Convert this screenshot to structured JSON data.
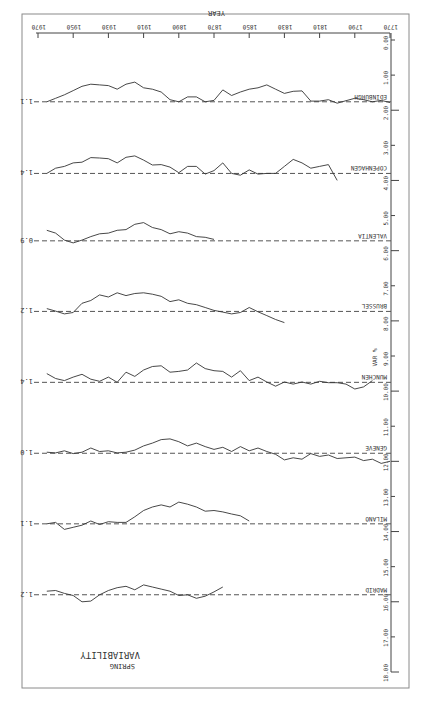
{
  "chart_data": {
    "type": "line",
    "title": "VARIABILITY",
    "subtitle": "SPRING",
    "xlabel": "YEAR",
    "ylabel": "VAR %",
    "xlim": [
      1770,
      1970
    ],
    "ylim": [
      0,
      18
    ],
    "x_ticks": [
      "1770",
      "1790",
      "1810",
      "1830",
      "1850",
      "1870",
      "1890",
      "1910",
      "1930",
      "1950",
      "1970"
    ],
    "y_ticks": [
      "0.00",
      "1.00",
      "2.00",
      "3.00",
      "4.00",
      "5.00",
      "6.00",
      "7.00",
      "8.00",
      "9.00",
      "10.00",
      "11.00",
      "12.00",
      "13.00",
      "14.00",
      "15.00",
      "16.00",
      "17.00",
      "18.00"
    ],
    "grid": false,
    "legend_position": "none",
    "series": [
      {
        "name": "EDINBURGH",
        "mean_value": "1.1",
        "baseline": 1.76,
        "x": [
          1770,
          1775,
          1780,
          1785,
          1790,
          1795,
          1800,
          1805,
          1810,
          1815,
          1820,
          1825,
          1830,
          1835,
          1840,
          1845,
          1850,
          1855,
          1860,
          1865,
          1870,
          1875,
          1880,
          1885,
          1890,
          1895,
          1900,
          1905,
          1910,
          1915,
          1920,
          1925,
          1930,
          1935,
          1940,
          1945,
          1950,
          1955,
          1960,
          1965
        ],
        "y": [
          1.78,
          1.72,
          1.76,
          1.7,
          1.66,
          1.73,
          1.8,
          1.7,
          1.74,
          1.74,
          1.45,
          1.46,
          1.52,
          1.4,
          1.28,
          1.36,
          1.4,
          1.48,
          1.58,
          1.42,
          1.72,
          1.76,
          1.62,
          1.62,
          1.76,
          1.7,
          1.48,
          1.4,
          1.36,
          1.2,
          1.26,
          1.4,
          1.3,
          1.28,
          1.26,
          1.32,
          1.44,
          1.56,
          1.66,
          1.76
        ]
      },
      {
        "name": "COPENHAGEN",
        "mean_value": "1.4",
        "baseline": 3.8,
        "x": [
          1800,
          1805,
          1810,
          1815,
          1820,
          1825,
          1830,
          1835,
          1840,
          1845,
          1850,
          1855,
          1860,
          1865,
          1870,
          1875,
          1880,
          1885,
          1890,
          1895,
          1900,
          1905,
          1910,
          1915,
          1920,
          1925,
          1930,
          1935,
          1940,
          1945,
          1950,
          1955,
          1960,
          1965
        ],
        "y": [
          4.0,
          3.55,
          3.6,
          3.65,
          3.5,
          3.4,
          3.6,
          3.8,
          3.8,
          3.82,
          3.7,
          3.85,
          3.8,
          3.5,
          3.72,
          3.82,
          3.6,
          3.6,
          3.78,
          3.62,
          3.55,
          3.56,
          3.42,
          3.3,
          3.34,
          3.5,
          3.38,
          3.36,
          3.35,
          3.48,
          3.5,
          3.6,
          3.65,
          3.8
        ]
      },
      {
        "name": "VALENTIA",
        "mean_value": "0.9",
        "baseline": 5.72,
        "x": [
          1870,
          1875,
          1880,
          1885,
          1890,
          1895,
          1900,
          1905,
          1910,
          1915,
          1920,
          1925,
          1930,
          1935,
          1940,
          1945,
          1950,
          1955,
          1960,
          1965
        ],
        "y": [
          5.68,
          5.62,
          5.6,
          5.5,
          5.46,
          5.52,
          5.4,
          5.34,
          5.2,
          5.25,
          5.4,
          5.42,
          5.5,
          5.52,
          5.6,
          5.7,
          5.78,
          5.7,
          5.5,
          5.42
        ]
      },
      {
        "name": "BRUSSEL",
        "mean_value": "1.2",
        "baseline": 7.73,
        "x": [
          1830,
          1835,
          1840,
          1845,
          1850,
          1855,
          1860,
          1865,
          1870,
          1875,
          1880,
          1885,
          1890,
          1895,
          1900,
          1905,
          1910,
          1915,
          1920,
          1925,
          1930,
          1935,
          1940,
          1945,
          1950,
          1955,
          1960,
          1965
        ],
        "y": [
          8.05,
          7.96,
          7.85,
          7.74,
          7.62,
          7.76,
          7.8,
          7.75,
          7.7,
          7.62,
          7.54,
          7.5,
          7.4,
          7.45,
          7.3,
          7.24,
          7.2,
          7.22,
          7.28,
          7.2,
          7.32,
          7.26,
          7.42,
          7.5,
          7.76,
          7.8,
          7.72,
          7.65
        ]
      },
      {
        "name": "MUNCHEN",
        "mean_value": "1.4",
        "baseline": 9.75,
        "x": [
          1780,
          1785,
          1790,
          1795,
          1800,
          1805,
          1810,
          1815,
          1820,
          1825,
          1830,
          1835,
          1840,
          1845,
          1850,
          1855,
          1860,
          1865,
          1870,
          1875,
          1880,
          1885,
          1890,
          1895,
          1900,
          1905,
          1910,
          1915,
          1920,
          1925,
          1930,
          1935,
          1940,
          1945,
          1950,
          1955,
          1960,
          1965
        ],
        "y": [
          9.7,
          9.88,
          9.94,
          9.8,
          9.76,
          9.76,
          9.72,
          9.8,
          9.74,
          9.8,
          9.74,
          9.86,
          9.74,
          9.6,
          9.7,
          9.42,
          9.6,
          9.44,
          9.42,
          9.36,
          9.2,
          9.4,
          9.44,
          9.46,
          9.28,
          9.3,
          9.4,
          9.58,
          9.46,
          9.75,
          9.6,
          9.72,
          9.66,
          9.52,
          9.6,
          9.7,
          9.64,
          9.5
        ]
      },
      {
        "name": "GENEVE",
        "mean_value": "1.0",
        "baseline": 11.77,
        "x": [
          1770,
          1775,
          1780,
          1785,
          1790,
          1795,
          1800,
          1805,
          1810,
          1815,
          1820,
          1825,
          1830,
          1835,
          1840,
          1845,
          1850,
          1855,
          1860,
          1865,
          1870,
          1875,
          1880,
          1885,
          1890,
          1895,
          1900,
          1905,
          1910,
          1915,
          1920,
          1925,
          1930,
          1935,
          1940,
          1945,
          1950,
          1955,
          1960,
          1965
        ],
        "y": [
          12.0,
          12.06,
          11.94,
          11.98,
          11.88,
          11.9,
          11.92,
          11.82,
          11.86,
          11.78,
          11.94,
          11.9,
          11.96,
          11.8,
          11.72,
          11.62,
          11.7,
          11.58,
          11.72,
          11.6,
          11.66,
          11.58,
          11.48,
          11.56,
          11.44,
          11.36,
          11.38,
          11.48,
          11.56,
          11.68,
          11.74,
          11.76,
          11.7,
          11.72,
          11.62,
          11.74,
          11.78,
          11.7,
          11.76,
          11.74
        ]
      },
      {
        "name": "MILANO",
        "mean_value": "1.1",
        "baseline": 13.78,
        "x": [
          1850,
          1855,
          1860,
          1865,
          1870,
          1875,
          1880,
          1885,
          1890,
          1895,
          1900,
          1905,
          1910,
          1915,
          1920,
          1925,
          1930,
          1935,
          1940,
          1945,
          1950,
          1955,
          1960,
          1965
        ],
        "y": [
          13.7,
          13.55,
          13.5,
          13.44,
          13.4,
          13.42,
          13.3,
          13.22,
          13.16,
          13.3,
          13.24,
          13.3,
          13.4,
          13.58,
          13.74,
          13.74,
          13.72,
          13.8,
          13.7,
          13.82,
          13.88,
          13.94,
          13.74,
          13.78
        ]
      },
      {
        "name": "MADRID",
        "mean_value": "1.2",
        "baseline": 15.8,
        "x": [
          1865,
          1870,
          1875,
          1880,
          1885,
          1890,
          1895,
          1900,
          1905,
          1910,
          1915,
          1920,
          1925,
          1930,
          1935,
          1940,
          1945,
          1950,
          1955,
          1960,
          1965
        ],
        "y": [
          15.58,
          15.72,
          15.84,
          15.9,
          15.8,
          15.82,
          15.7,
          15.64,
          15.58,
          15.52,
          15.66,
          15.56,
          15.6,
          15.68,
          15.8,
          15.98,
          16.0,
          15.82,
          15.76,
          15.68,
          15.7
        ]
      }
    ]
  }
}
